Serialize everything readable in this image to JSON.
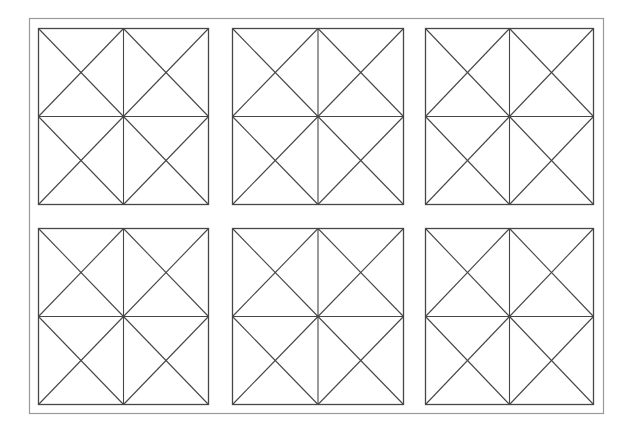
{
  "diagram": {
    "title": "",
    "colors": {
      "background": "#ffffff",
      "frame_stroke": "#9a9a9a",
      "line_stroke": "#474747"
    },
    "frame": {
      "x": 29,
      "y": 18,
      "width": 574,
      "height": 395
    },
    "squares": [
      {
        "id": "square-r1-c1",
        "x": 38,
        "y": 28,
        "width": 170,
        "height": 176
      },
      {
        "id": "square-r1-c2",
        "x": 232,
        "y": 28,
        "width": 171,
        "height": 176
      },
      {
        "id": "square-r1-c3",
        "x": 425,
        "y": 28,
        "width": 168,
        "height": 176
      },
      {
        "id": "square-r2-c1",
        "x": 38,
        "y": 228,
        "width": 170,
        "height": 176
      },
      {
        "id": "square-r2-c2",
        "x": 232,
        "y": 228,
        "width": 171,
        "height": 176
      },
      {
        "id": "square-r2-c3",
        "x": 425,
        "y": 228,
        "width": 168,
        "height": 176
      }
    ]
  }
}
